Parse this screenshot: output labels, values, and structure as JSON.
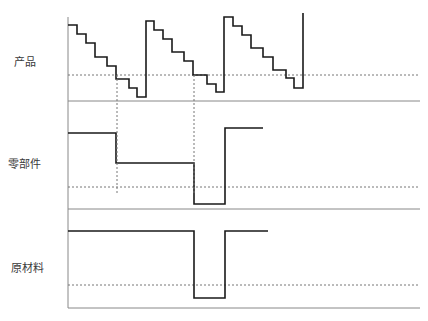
{
  "diagram": {
    "type": "inventory-level timing diagram",
    "panels": [
      {
        "id": "product",
        "label": "产品",
        "label_pos": {
          "x": 14,
          "y": 53
        },
        "baseline_y": 101,
        "threshold_y": 75,
        "line_points": "68,25 77,25 77,34 86,34 86,43 95,43 95,57 107,57 107,66 116,66 116,79 129,79 129,88 137,88 137,97 146,97 146,21 154,21 154,30 163,30 163,39 172,39 172,52 184,52 184,61 193,61 193,75 207,75 207,84 216,84 216,92 224,92 224,17 233,17 233,26 242,26 242,35 251,35 251,48 263,48 263,57 273,57 273,70 286,70 286,78 294,78 294,88 303,88 303,13"
      },
      {
        "id": "component",
        "label": "零部件",
        "label_pos": {
          "x": 8,
          "y": 155
        },
        "baseline_y": 209,
        "threshold_y": 187,
        "line_points": "68,133 116,133 116,163 194,163 194,204 225,204 225,128 263,128"
      },
      {
        "id": "raw-material",
        "label": "原材料",
        "label_pos": {
          "x": 11,
          "y": 259
        },
        "baseline_y": 308,
        "threshold_y": 285,
        "line_points": "68,231 194,231 194,298 225,298 225,231 268,231"
      }
    ],
    "axis": {
      "x": 68,
      "top": 17,
      "bottom": 308,
      "right": 420
    },
    "vertical_guides": [
      {
        "x": 117,
        "y1": 75,
        "y2": 195
      },
      {
        "x": 194,
        "y1": 75,
        "y2": 195
      }
    ],
    "colors": {
      "step_line": "#1a1a1a",
      "axis": "#888888",
      "dashed": "#777777",
      "label": "#3a3a3a"
    }
  }
}
